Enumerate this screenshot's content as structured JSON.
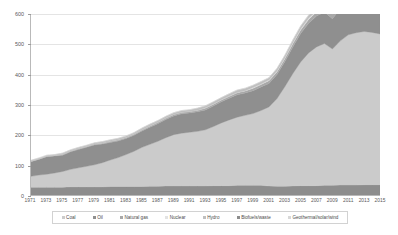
{
  "chart_data": {
    "type": "area",
    "title": "",
    "subtitle": "",
    "xlabel": "",
    "ylabel": "",
    "stacked": true,
    "grid": true,
    "legend_position": "bottom",
    "xlim": [
      1971,
      2015
    ],
    "ylim": [
      0,
      600
    ],
    "yticks": [
      0,
      100,
      200,
      300,
      400,
      500,
      600
    ],
    "ytick_labels": [
      "0",
      "100",
      "200",
      "300",
      "400",
      "500",
      "600"
    ],
    "xtick_labels": [
      "1971",
      "1973",
      "1975",
      "1977",
      "1979",
      "1981",
      "1983",
      "1985",
      "1987",
      "1989",
      "1991",
      "1993",
      "1995",
      "1997",
      "1999",
      "2001",
      "2003",
      "2005",
      "2007",
      "2009",
      "2011",
      "2013",
      "2015"
    ],
    "x": [
      1971,
      1972,
      1973,
      1974,
      1975,
      1976,
      1977,
      1978,
      1979,
      1980,
      1981,
      1982,
      1983,
      1984,
      1985,
      1986,
      1987,
      1988,
      1989,
      1990,
      1991,
      1992,
      1993,
      1994,
      1995,
      1996,
      1997,
      1998,
      1999,
      2000,
      2001,
      2002,
      2003,
      2004,
      2005,
      2006,
      2007,
      2008,
      2009,
      2010,
      2011,
      2012,
      2013,
      2014,
      2015
    ],
    "series": [
      {
        "name": "Biofuels/waste",
        "color": "#8d8d8d",
        "values": [
          26,
          26,
          26,
          26,
          26,
          27,
          27,
          27,
          27,
          27,
          28,
          28,
          28,
          28,
          28,
          29,
          29,
          30,
          30,
          30,
          30,
          30,
          30,
          31,
          31,
          31,
          32,
          32,
          32,
          32,
          30,
          29,
          29,
          30,
          31,
          31,
          31,
          32,
          32,
          33,
          33,
          33,
          34,
          34,
          34
        ]
      },
      {
        "name": "Coal",
        "color": "#cbcbcb",
        "values": [
          36,
          40,
          43,
          47,
          52,
          58,
          63,
          68,
          73,
          80,
          88,
          96,
          106,
          117,
          130,
          139,
          149,
          160,
          170,
          175,
          178,
          181,
          186,
          196,
          208,
          218,
          226,
          232,
          238,
          248,
          262,
          290,
          330,
          372,
          410,
          440,
          460,
          470,
          452,
          478,
          498,
          505,
          508,
          505,
          500
        ]
      },
      {
        "name": "Oil",
        "color": "#8f8f8f",
        "values": [
          48,
          52,
          58,
          56,
          54,
          58,
          61,
          63,
          66,
          62,
          58,
          55,
          53,
          53,
          54,
          57,
          58,
          60,
          62,
          64,
          64,
          65,
          66,
          68,
          70,
          72,
          74,
          74,
          76,
          78,
          78,
          80,
          83,
          88,
          94,
          98,
          102,
          104,
          100,
          106,
          110,
          112,
          114,
          116,
          118
        ]
      },
      {
        "name": "Natural gas",
        "color": "#a8a8a8",
        "values": [
          2,
          2,
          2,
          2,
          3,
          3,
          3,
          3,
          3,
          3,
          4,
          4,
          4,
          4,
          4,
          4,
          5,
          5,
          5,
          5,
          5,
          5,
          6,
          6,
          6,
          6,
          7,
          7,
          8,
          8,
          9,
          9,
          10,
          11,
          12,
          13,
          14,
          15,
          16,
          18,
          20,
          21,
          22,
          23,
          24
        ]
      },
      {
        "name": "Nuclear",
        "color": "#e3e3e3",
        "values": [
          0,
          0,
          0,
          0,
          0,
          0,
          0,
          0,
          0,
          0,
          0,
          0,
          0,
          0,
          0,
          0,
          0,
          0,
          0,
          0,
          0,
          0,
          1,
          1,
          1,
          1,
          1,
          1,
          2,
          2,
          2,
          2,
          2,
          3,
          3,
          4,
          4,
          5,
          5,
          6,
          6,
          3,
          3,
          4,
          5
        ]
      },
      {
        "name": "Hydro",
        "color": "#bfbfbf",
        "values": [
          3,
          3,
          3,
          3,
          4,
          4,
          4,
          4,
          4,
          5,
          5,
          5,
          5,
          5,
          6,
          6,
          6,
          6,
          6,
          6,
          6,
          7,
          7,
          7,
          7,
          8,
          8,
          8,
          8,
          8,
          8,
          9,
          9,
          9,
          10,
          10,
          11,
          11,
          12,
          12,
          13,
          14,
          15,
          16,
          17
        ]
      },
      {
        "name": "Geothermal/solar/wind",
        "color": "#d8d8d8",
        "values": [
          0,
          0,
          0,
          0,
          0,
          0,
          0,
          0,
          0,
          0,
          0,
          0,
          0,
          0,
          0,
          0,
          0,
          0,
          0,
          0,
          0,
          0,
          0,
          0,
          0,
          0,
          0,
          0,
          0,
          0,
          0,
          0,
          0,
          1,
          1,
          1,
          1,
          2,
          2,
          3,
          4,
          5,
          6,
          7,
          8
        ]
      }
    ],
    "totals": [
      115,
      123,
      132,
      134,
      139,
      150,
      158,
      165,
      173,
      177,
      183,
      188,
      196,
      207,
      222,
      235,
      247,
      261,
      273,
      280,
      283,
      288,
      295,
      309,
      323,
      336,
      348,
      354,
      364,
      376,
      389,
      419,
      463,
      514,
      561,
      597,
      623,
      639,
      619,
      656,
      684,
      693,
      702,
      705,
      706
    ]
  },
  "legend": {
    "items": [
      {
        "label": "Coal",
        "color": "#cbcbcb"
      },
      {
        "label": "Oil",
        "color": "#8f8f8f"
      },
      {
        "label": "Natural gas",
        "color": "#a8a8a8"
      },
      {
        "label": "Nuclear",
        "color": "#e3e3e3"
      },
      {
        "label": "Hydro",
        "color": "#bfbfbf"
      },
      {
        "label": "Biofuels/waste",
        "color": "#8d8d8d"
      },
      {
        "label": "Geothermal/solar/wind",
        "color": "#d8d8d8"
      }
    ]
  },
  "colors": {
    "background": "#ffffff",
    "axis": "#b9b9b9",
    "grid": "#e4e4e4",
    "text": "#595959"
  }
}
